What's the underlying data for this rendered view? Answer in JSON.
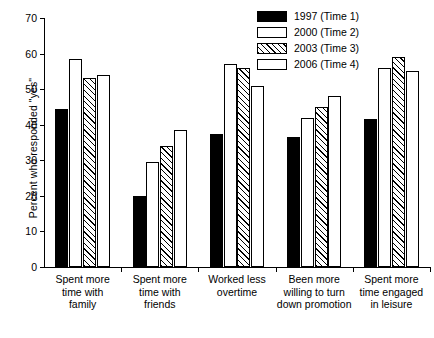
{
  "chart_data": {
    "type": "bar",
    "title": "",
    "subtitle": "",
    "xlabel": "",
    "ylabel": "Percent who responded \"yes\"",
    "ylim": [
      0,
      70
    ],
    "ytick_step": 10,
    "yticks": [
      0,
      10,
      20,
      30,
      40,
      50,
      60,
      70
    ],
    "grid": false,
    "legend_position": "top-right",
    "orientation": "vertical",
    "grouped": true,
    "categories": [
      "Spent more\ntime with\nfamily",
      "Spent more\ntime with\nfriends",
      "Worked less\novertime",
      "Been more\nwilling to turn\ndown promotion",
      "Spent more\ntime engaged\nin leisure"
    ],
    "series": [
      {
        "name": "1997 (Time 1)",
        "pattern": "solid-black",
        "color": "#000000",
        "values": [
          44.5,
          20.0,
          37.5,
          36.5,
          41.5
        ]
      },
      {
        "name": "2000 (Time 2)",
        "pattern": "stippled-dots",
        "color": "#ffffff",
        "values": [
          58.5,
          29.5,
          57.0,
          42.0,
          56.0
        ]
      },
      {
        "name": "2003 (Time 3)",
        "pattern": "diagonal-hatch",
        "color": "#ffffff",
        "values": [
          53.0,
          34.0,
          56.0,
          45.0,
          59.0
        ]
      },
      {
        "name": "2006 (Time 4)",
        "pattern": "empty-white",
        "color": "#ffffff",
        "values": [
          54.0,
          38.5,
          51.0,
          48.0,
          55.0
        ]
      }
    ]
  }
}
